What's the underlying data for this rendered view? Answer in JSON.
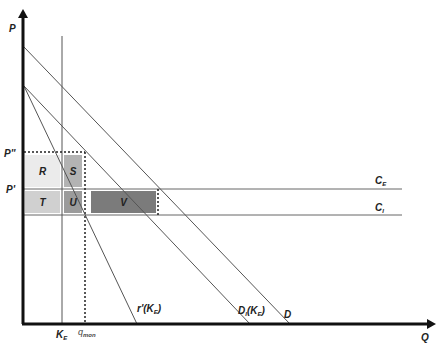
{
  "axes": {
    "y_label": "P",
    "x_label": "Q"
  },
  "price_levels": [
    {
      "id": "p_double_prime",
      "label": "P''",
      "y": 152
    },
    {
      "id": "p_prime",
      "label": "P'",
      "y": 189
    }
  ],
  "cost_lines": [
    {
      "id": "c_e",
      "label": "C",
      "sub": "E",
      "y": 189
    },
    {
      "id": "c_i",
      "label": "C",
      "sub": "I",
      "y": 215
    }
  ],
  "quantity_markers": [
    {
      "id": "k_e",
      "label": "K",
      "sub": "E",
      "x": 62
    },
    {
      "id": "q_mon",
      "label": "q",
      "sub": "mon",
      "x": 85
    }
  ],
  "curves": [
    {
      "id": "D",
      "label": "D",
      "sub": ""
    },
    {
      "id": "D_I",
      "label": "D",
      "sub": "I",
      "suffix": "(K",
      "suffix_sub": "E",
      "suffix_end": ")"
    },
    {
      "id": "r_prime",
      "label": "r'(K",
      "sub": "E",
      "suffix_end": ")"
    }
  ],
  "areas": [
    {
      "id": "R",
      "label": "R",
      "color": "#ebebeb"
    },
    {
      "id": "S",
      "label": "S",
      "color": "#b3b3b3"
    },
    {
      "id": "T",
      "label": "T",
      "color": "#d0d0d0"
    },
    {
      "id": "U",
      "label": "U",
      "color": "#9b9b9b"
    },
    {
      "id": "V",
      "label": "V",
      "color": "#7b7b7b"
    }
  ],
  "colors": {
    "axis": "#111111",
    "line": "#555555",
    "dotted": "#222222"
  }
}
